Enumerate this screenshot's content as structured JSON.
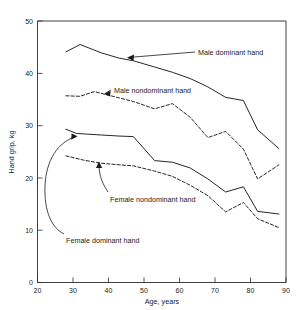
{
  "chart_data": {
    "type": "line",
    "title": "",
    "xlabel": "Age, years",
    "ylabel": "Hand grip, kg",
    "xlim": [
      20,
      90
    ],
    "ylim": [
      0,
      50
    ],
    "xticks": [
      20,
      30,
      40,
      50,
      60,
      70,
      80,
      90
    ],
    "yticks": [
      0,
      10,
      20,
      30,
      40,
      50
    ],
    "grid": false,
    "legend_position": "inline-annotations",
    "series": [
      {
        "name": "Male dominant hand",
        "style": "solid",
        "label": "Male dominant hand",
        "x": [
          28,
          32,
          38,
          43,
          47,
          53,
          58,
          63,
          68,
          73,
          78,
          82,
          88
        ],
        "y": [
          44.1,
          45.5,
          43.9,
          42.9,
          42.4,
          41.2,
          40.2,
          39.0,
          37.4,
          35.4,
          34.8,
          29.2,
          25.6
        ]
      },
      {
        "name": "Male nondominant hand",
        "style": "dashed",
        "label": "Male nondominant hand",
        "x": [
          28,
          32,
          36,
          43,
          47,
          53,
          58,
          63,
          68,
          73,
          78,
          82,
          88
        ],
        "y": [
          35.7,
          35.6,
          36.5,
          35.3,
          34.6,
          33.2,
          34.2,
          31.6,
          27.7,
          28.9,
          25.5,
          19.8,
          22.5
        ]
      },
      {
        "name": "Female dominant hand",
        "style": "solid",
        "label": "Female dominant hand",
        "x": [
          28,
          31,
          38,
          43,
          47,
          53,
          58,
          63,
          68,
          73,
          78,
          82,
          88
        ],
        "y": [
          29.3,
          28.5,
          28.2,
          28.0,
          27.9,
          23.3,
          23.0,
          21.9,
          19.8,
          17.3,
          18.3,
          13.6,
          13.1
        ]
      },
      {
        "name": "Female nondominant hand",
        "style": "dashed",
        "label": "Female nondominant hand",
        "x": [
          28,
          33,
          38,
          43,
          47,
          53,
          58,
          63,
          68,
          73,
          78,
          82,
          88
        ],
        "y": [
          24.2,
          23.4,
          22.8,
          22.5,
          22.3,
          21.3,
          20.3,
          18.6,
          16.6,
          13.5,
          15.3,
          12.2,
          10.5
        ]
      }
    ],
    "annotations": [
      {
        "text": "Male dominant hand",
        "points_to_series": "Male dominant hand"
      },
      {
        "text": "Male nondominant hand",
        "points_to_series": "Male nondominant hand"
      },
      {
        "text": "Female nondominant hand",
        "points_to_series": "Female nondominant hand"
      },
      {
        "text": "Female dominant hand",
        "points_to_series": "Female dominant hand"
      }
    ]
  },
  "axes": {
    "x_title": "Age, years",
    "y_title": "Hand grip, kg",
    "x_tick_labels": [
      "20",
      "30",
      "40",
      "50",
      "60",
      "70",
      "80",
      "90"
    ],
    "y_tick_labels": [
      "0",
      "10",
      "20",
      "30",
      "40",
      "50"
    ]
  },
  "labels": {
    "male_dominant": "Male dominant hand",
    "male_nondominant": "Male nondominant hand",
    "female_nondominant": "Female nondominant hand",
    "female_dominant": "Female dominant hand"
  },
  "colors": {
    "line": "#1a1a1a",
    "frame": "#2b2b2b",
    "background": "#ffffff"
  }
}
